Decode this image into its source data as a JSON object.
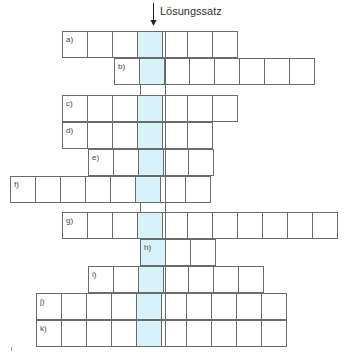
{
  "header": {
    "solution_label": "Lösungssatz",
    "arrow_icon": "arrow-down-icon"
  },
  "colors": {
    "highlight": "#d7f2f9",
    "grid_line": "#6b6b6b",
    "background": "#ffffff"
  },
  "grid": {
    "cell_width": 26,
    "cell_height": 27,
    "origin_x": 10,
    "solution_column": 5,
    "rows": [
      {
        "label": "a)",
        "start_col": 2,
        "length": 7,
        "top": 31
      },
      {
        "label": "b)",
        "start_col": 4,
        "length": 8,
        "top": 58
      },
      {
        "label": "c)",
        "start_col": 2,
        "length": 7,
        "top": 95
      },
      {
        "label": "d)",
        "start_col": 2,
        "length": 6,
        "top": 122
      },
      {
        "label": "e)",
        "start_col": 3,
        "length": 5,
        "top": 149
      },
      {
        "label": "f)",
        "start_col": 0,
        "length": 8,
        "top": 176
      },
      {
        "label": "g)",
        "start_col": 2,
        "length": 11,
        "top": 212
      },
      {
        "label": "h)",
        "start_col": 5,
        "length": 3,
        "top": 239
      },
      {
        "label": "i)",
        "start_col": 3,
        "length": 7,
        "top": 266
      },
      {
        "label": "j)",
        "start_col": 1,
        "length": 10,
        "top": 293
      },
      {
        "label": "k)",
        "start_col": 1,
        "length": 10,
        "top": 320
      }
    ]
  }
}
